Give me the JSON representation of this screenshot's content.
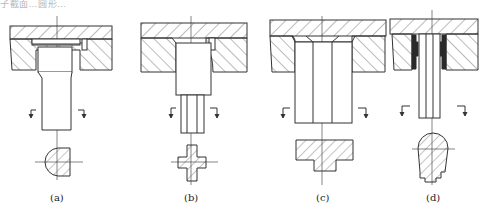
{
  "header": {
    "text": "子截面…圆形…"
  },
  "figures": [
    {
      "id": "a",
      "caption": "(a)",
      "section_shape": "half-round (D-shape)"
    },
    {
      "id": "b",
      "caption": "(b)",
      "section_shape": "cross"
    },
    {
      "id": "c",
      "caption": "(c)",
      "section_shape": "inverted T"
    },
    {
      "id": "d",
      "caption": "(d)",
      "section_shape": "rounded bullet"
    }
  ],
  "colors": {
    "line": "#333333",
    "hatch": "#555555",
    "seal": "#2a2a2a",
    "background": "#ffffff"
  }
}
